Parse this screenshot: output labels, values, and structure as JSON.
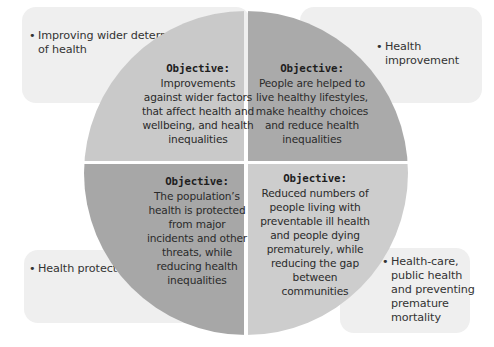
{
  "diagram": {
    "type": "quadrant-circle",
    "colors": {
      "background": "#ffffff",
      "outer_box": "#efefef",
      "quadrant_top_left": "#c9c9c9",
      "quadrant_top_right": "#aaaaaa",
      "quadrant_bottom_left": "#a7a7a7",
      "quadrant_bottom_right": "#cdcdcd",
      "text": "#2a2a2a"
    },
    "bullet_symbol": "•",
    "quadrants": [
      {
        "position": "top-left",
        "domain_label": "Improving wider determinants of health",
        "objective_title": "Objective:",
        "objective_text": "Improvements against wider factors that affect health and wellbeing, and health inequalities"
      },
      {
        "position": "top-right",
        "domain_label": "Health improvement",
        "objective_title": "Objective:",
        "objective_text": "People are helped to live healthy lifestyles, make healthy choices and reduce health inequalities"
      },
      {
        "position": "bottom-left",
        "domain_label": "Health protection",
        "objective_title": "Objective:",
        "objective_text": "The population’s health is protected from major incidents and other threats, while reducing health inequalities"
      },
      {
        "position": "bottom-right",
        "domain_label": "Health-care, public health and preventing premature mortality",
        "objective_title": "Objective:",
        "objective_text": "Reduced numbers of people living with preventable ill health and people dying prematurely, while reducing the gap between communities"
      }
    ]
  }
}
